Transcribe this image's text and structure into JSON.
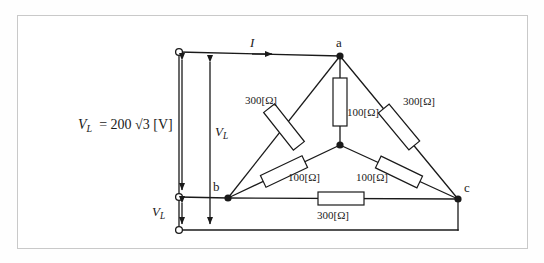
{
  "figure": {
    "type": "circuit-diagram",
    "border_color": "#c9c9c9",
    "line_color": "#1a1a1a",
    "background": "#ffffff"
  },
  "source": {
    "label_text": "VL = 200 √3 [V]",
    "symbol": "V",
    "subscript": "L",
    "equals": "=",
    "magnitude": "200",
    "radical": "√3",
    "unit": "[V]"
  },
  "measurements": {
    "line_voltage_main": {
      "symbol": "V",
      "subscript": "L"
    },
    "line_voltage_lower": {
      "symbol": "V",
      "subscript": "L"
    },
    "current": {
      "symbol": "I"
    }
  },
  "nodes": [
    {
      "id": "a",
      "label": "a",
      "x": 340,
      "y": 56
    },
    {
      "id": "b",
      "label": "b",
      "x": 228,
      "y": 198
    },
    {
      "id": "c",
      "label": "c",
      "x": 458,
      "y": 199
    },
    {
      "id": "n",
      "label": "",
      "x": 340,
      "y": 145
    }
  ],
  "terminals": [
    {
      "id": "t1",
      "x": 179,
      "y": 52
    },
    {
      "id": "t2",
      "x": 179,
      "y": 197
    },
    {
      "id": "t3",
      "x": 179,
      "y": 230
    }
  ],
  "resistors": [
    {
      "id": "r-ab-delta",
      "value": "300[Ω]",
      "ohms": 300,
      "between": "a-b",
      "orientation": "diagonal"
    },
    {
      "id": "r-ac-delta",
      "value": "300[Ω]",
      "ohms": 300,
      "between": "a-c",
      "orientation": "diagonal"
    },
    {
      "id": "r-bc-delta",
      "value": "300[Ω]",
      "ohms": 300,
      "between": "b-c",
      "orientation": "horizontal"
    },
    {
      "id": "r-an-wye",
      "value": "100[Ω]",
      "ohms": 100,
      "between": "a-n",
      "orientation": "vertical"
    },
    {
      "id": "r-bn-wye",
      "value": "100[Ω]",
      "ohms": 100,
      "between": "b-n",
      "orientation": "diagonal"
    },
    {
      "id": "r-cn-wye",
      "value": "100[Ω]",
      "ohms": 100,
      "between": "c-n",
      "orientation": "diagonal"
    }
  ],
  "labels": {
    "node_a": "a",
    "node_b": "b",
    "node_c": "c",
    "r300_left": "300[Ω]",
    "r300_right": "300[Ω]",
    "r300_bottom": "300[Ω]",
    "r100_center": "100[Ω]",
    "r100_left": "100[Ω]",
    "r100_right": "100[Ω]"
  }
}
